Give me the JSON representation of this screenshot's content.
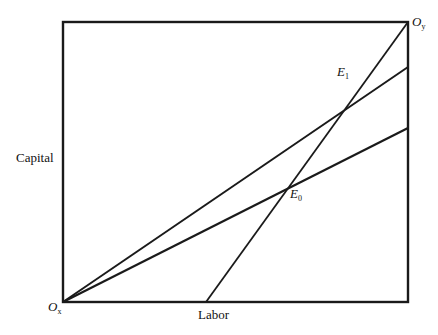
{
  "diagram": {
    "type": "edgeworth-box",
    "axes": {
      "x_label": "Labor",
      "y_label": "Capital"
    },
    "origins": {
      "bottom_left": {
        "main": "O",
        "sub": "x"
      },
      "top_right": {
        "main": "O",
        "sub": "y"
      }
    },
    "points": [
      {
        "main": "E",
        "sub": "0"
      },
      {
        "main": "E",
        "sub": "1"
      }
    ],
    "colors": {
      "line": "#1a1a1a",
      "background": "#ffffff"
    },
    "geometry": {
      "box": {
        "x1": 63,
        "y1": 22,
        "x2": 408,
        "y2": 302
      },
      "lines": [
        {
          "name": "upper-ray-from-ox",
          "from": [
            63,
            302
          ],
          "to": [
            408,
            67
          ]
        },
        {
          "name": "lower-ray-from-ox",
          "from": [
            63,
            302
          ],
          "to": [
            408,
            128
          ]
        },
        {
          "name": "steep-ray-to-oy",
          "from": [
            206,
            302
          ],
          "to": [
            408,
            22
          ]
        }
      ]
    }
  }
}
